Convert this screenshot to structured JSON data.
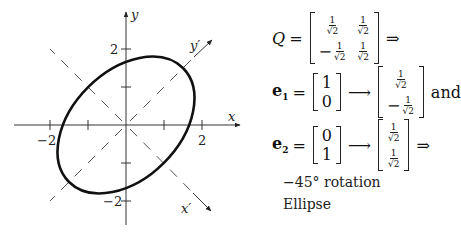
{
  "diagram": {
    "axes": {
      "x_label": "x",
      "y_label": "y",
      "x_prime_label": "x′",
      "y_prime_label": "y′",
      "tick_values": [
        -2,
        -1,
        1,
        2
      ],
      "labeled_ticks": {
        "x": [
          "-2",
          "2"
        ],
        "y": [
          "2",
          "-2"
        ]
      },
      "tick_label_text": {
        "x_neg2": "−2",
        "x_pos2": "2",
        "y_pos2": "2",
        "y_neg2": "−2"
      },
      "range": [
        -3,
        3
      ]
    },
    "ellipse": {
      "center": [
        0,
        0
      ],
      "major_axis_direction": "y′ (45°)",
      "semi_major": 2.12,
      "semi_minor": 1.41,
      "rotation_deg": 45
    },
    "colors": {
      "ink": "#111111",
      "axis": "#333333",
      "dashed": "#555555",
      "background": "#ffffff"
    }
  },
  "equations": {
    "Q_label": "Q",
    "equals": "=",
    "implies": "⇒",
    "arrow": "⟶",
    "one": "1",
    "sqrt2": "√2",
    "minus": "−",
    "zero": "0",
    "e1_label": "e",
    "e1_sub": "1",
    "e2_label": "e",
    "e2_sub": "2",
    "and_text": "and",
    "rotation_text": "−45° rotation",
    "conclusion_text": "Ellipse"
  }
}
